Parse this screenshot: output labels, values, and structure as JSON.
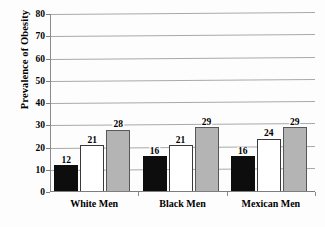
{
  "chart_data": {
    "type": "bar",
    "title": "",
    "xlabel": "",
    "ylabel": "Prevalence of Obesity",
    "ylim": [
      0,
      80
    ],
    "yticks": [
      0,
      10,
      20,
      30,
      40,
      50,
      60,
      70,
      80
    ],
    "ytick_labels": [
      "0",
      "10",
      "20",
      "30",
      "40",
      "50",
      "60",
      "70",
      "80"
    ],
    "grid": true,
    "legend": "none",
    "categories": [
      "White Men",
      "Black Men",
      "Mexican Men"
    ],
    "series": [
      {
        "name": "series-1",
        "style": "black",
        "values": [
          12,
          16,
          16
        ],
        "labels": [
          "12",
          "16",
          "16"
        ]
      },
      {
        "name": "series-2",
        "style": "white",
        "values": [
          21,
          21,
          24
        ],
        "labels": [
          "21",
          "21",
          "24"
        ]
      },
      {
        "name": "series-3",
        "style": "gray",
        "values": [
          28,
          29,
          29
        ],
        "labels": [
          "28",
          "29",
          "29"
        ]
      }
    ],
    "colors": {
      "series_1_fill": "#0d0d0d",
      "series_2_fill": "#ffffff",
      "series_3_fill": "#b4b4b4",
      "bar_outline": "#3a3a3a",
      "gridline": "#a9a9a9",
      "axis": "#7d7d7d",
      "background": "#fdfdfd",
      "text": "#000000"
    }
  }
}
